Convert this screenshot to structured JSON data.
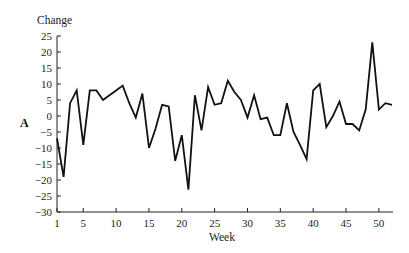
{
  "chart_data": {
    "type": "line",
    "title": "",
    "panel_label": "A",
    "xlabel": "Week",
    "ylabel": "Change",
    "xlim": [
      1,
      52
    ],
    "ylim": [
      -30,
      25
    ],
    "x_ticks": [
      1,
      5,
      10,
      15,
      20,
      25,
      30,
      35,
      40,
      45,
      50
    ],
    "y_ticks": [
      25,
      20,
      15,
      10,
      5,
      0,
      -5,
      -10,
      -15,
      -20,
      -25,
      -30
    ],
    "grid": false,
    "legend": null,
    "series": [
      {
        "name": "A",
        "color": "#111111",
        "x": [
          1,
          2,
          3,
          4,
          5,
          6,
          7,
          8,
          9,
          10,
          11,
          12,
          13,
          14,
          15,
          16,
          17,
          18,
          19,
          20,
          21,
          22,
          23,
          24,
          25,
          26,
          27,
          28,
          29,
          30,
          31,
          32,
          33,
          34,
          35,
          36,
          37,
          38,
          39,
          40,
          41,
          42,
          43,
          44,
          45,
          46,
          47,
          48,
          49,
          50,
          51,
          52
        ],
        "values": [
          -7,
          -19,
          4,
          8,
          -9,
          8,
          8,
          5,
          6.5,
          8,
          9.5,
          4,
          -0.5,
          7,
          -10,
          -4,
          3.5,
          3,
          -14,
          -6,
          -23,
          6.5,
          -4.5,
          9,
          3.5,
          4,
          11,
          7.5,
          5,
          -0.5,
          6.5,
          -1,
          -0.5,
          -6,
          -6,
          4,
          -5,
          -9,
          -13.5,
          8,
          10,
          -3.5,
          0,
          4.5,
          -2.5,
          -2.5,
          -4.5,
          2,
          23,
          2,
          4,
          3.5
        ]
      }
    ]
  }
}
